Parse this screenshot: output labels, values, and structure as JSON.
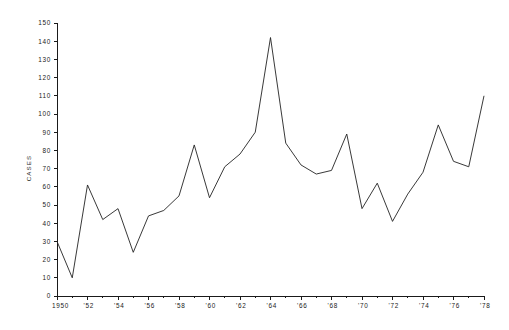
{
  "chart_data": {
    "type": "line",
    "title": "",
    "xlabel": "",
    "ylabel": "CASES",
    "xlim": [
      1950,
      1978
    ],
    "ylim": [
      0,
      150
    ],
    "grid": false,
    "legend": null,
    "x": [
      1950,
      1951,
      1952,
      1953,
      1954,
      1955,
      1956,
      1957,
      1958,
      1959,
      1960,
      1961,
      1962,
      1963,
      1964,
      1965,
      1966,
      1967,
      1968,
      1969,
      1970,
      1971,
      1972,
      1973,
      1974,
      1975,
      1976,
      1977,
      1978
    ],
    "values": [
      30,
      10,
      61,
      42,
      48,
      24,
      44,
      47,
      55,
      83,
      54,
      71,
      78,
      90,
      142,
      84,
      72,
      67,
      69,
      89,
      48,
      62,
      41,
      56,
      68,
      94,
      74,
      71,
      110
    ],
    "series": [
      {
        "name": "Cases",
        "color": "#232323",
        "values": [
          30,
          10,
          61,
          42,
          48,
          24,
          44,
          47,
          55,
          83,
          54,
          71,
          78,
          90,
          142,
          84,
          72,
          67,
          69,
          89,
          48,
          62,
          41,
          56,
          68,
          94,
          74,
          71,
          110
        ]
      }
    ],
    "y_ticks": [
      0,
      10,
      20,
      30,
      40,
      50,
      60,
      70,
      80,
      90,
      100,
      110,
      120,
      130,
      140,
      150
    ],
    "y_tick_labels": [
      "0",
      "10",
      "20",
      "30",
      "40",
      "50",
      "60",
      "70",
      "80",
      "90",
      "100",
      "110",
      "120",
      "130",
      "140",
      "150"
    ],
    "x_ticks": [
      1950,
      1951,
      1952,
      1953,
      1954,
      1955,
      1956,
      1957,
      1958,
      1959,
      1960,
      1961,
      1962,
      1963,
      1964,
      1965,
      1966,
      1967,
      1968,
      1969,
      1970,
      1971,
      1972,
      1973,
      1974,
      1975,
      1976,
      1977,
      1978
    ],
    "x_labeled_ticks": [
      1950,
      1952,
      1954,
      1956,
      1958,
      1960,
      1962,
      1964,
      1966,
      1968,
      1970,
      1972,
      1974,
      1976,
      1978
    ],
    "x_tick_labels": [
      "1950",
      "'52",
      "'54",
      "'56",
      "'58",
      "'60",
      "'62",
      "'64",
      "'66",
      "'68",
      "'70",
      "'72",
      "'74",
      "'76",
      "'78"
    ],
    "line_color": "#232323",
    "axis_color": "#1a1a1a",
    "background_color": "#ffffff"
  }
}
